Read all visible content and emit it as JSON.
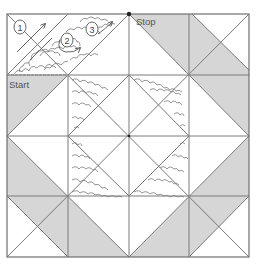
{
  "diagram": {
    "labels": {
      "start": "Start",
      "stop": "Stop"
    },
    "steps": [
      {
        "number": "1"
      },
      {
        "number": "2"
      },
      {
        "number": "3"
      }
    ],
    "colors": {
      "shade": "#d6d6d6",
      "line": "#7a7a7a",
      "stipple": "#666666",
      "background": "#ffffff",
      "marker": "#222222"
    }
  }
}
